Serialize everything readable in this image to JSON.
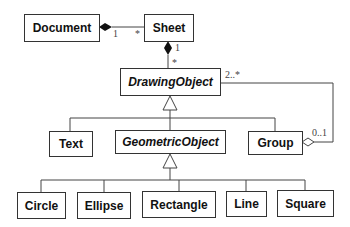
{
  "diagram": {
    "type": "uml-class-diagram",
    "classes": [
      {
        "id": "document",
        "label": "Document",
        "abstract": false
      },
      {
        "id": "sheet",
        "label": "Sheet",
        "abstract": false
      },
      {
        "id": "drawingobject",
        "label": "DrawingObject",
        "abstract": true
      },
      {
        "id": "text",
        "label": "Text",
        "abstract": false
      },
      {
        "id": "geometricobject",
        "label": "GeometricObject",
        "abstract": true
      },
      {
        "id": "group",
        "label": "Group",
        "abstract": false
      },
      {
        "id": "circle",
        "label": "Circle",
        "abstract": false
      },
      {
        "id": "ellipse",
        "label": "Ellipse",
        "abstract": false
      },
      {
        "id": "rectangle",
        "label": "Rectangle",
        "abstract": false
      },
      {
        "id": "line",
        "label": "Line",
        "abstract": false
      },
      {
        "id": "square",
        "label": "Square",
        "abstract": false
      }
    ],
    "multiplicities": {
      "doc_sheet_doc": "1",
      "doc_sheet_sheet": "*",
      "sheet_draw_sheet": "1",
      "sheet_draw_draw": "*",
      "group_draw_draw": "2..*",
      "group_draw_group": "0..1"
    },
    "relations": [
      {
        "type": "composition",
        "whole": "Document",
        "part": "Sheet"
      },
      {
        "type": "composition",
        "whole": "Sheet",
        "part": "DrawingObject"
      },
      {
        "type": "generalization",
        "parent": "DrawingObject",
        "children": [
          "Text",
          "GeometricObject",
          "Group"
        ]
      },
      {
        "type": "generalization",
        "parent": "GeometricObject",
        "children": [
          "Circle",
          "Ellipse",
          "Rectangle",
          "Line",
          "Square"
        ]
      },
      {
        "type": "aggregation",
        "whole": "Group",
        "part": "DrawingObject"
      }
    ]
  }
}
